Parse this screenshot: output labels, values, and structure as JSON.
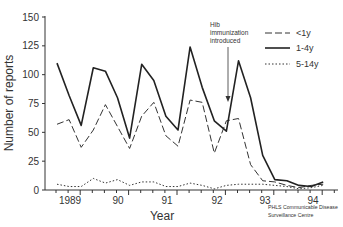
{
  "chart_data": {
    "type": "line",
    "title": "",
    "xlabel": "Year",
    "ylabel": "Number of reports",
    "ylim": [
      0,
      150
    ],
    "yticks": [
      0,
      25,
      50,
      75,
      100,
      125,
      150
    ],
    "xtick_labels": [
      "1989",
      "90",
      "91",
      "92",
      "93",
      "94"
    ],
    "x_quarters": [
      "1989Q1",
      "1989Q2",
      "1989Q3",
      "1989Q4",
      "1990Q1",
      "1990Q2",
      "1990Q3",
      "1990Q4",
      "1991Q1",
      "1991Q2",
      "1991Q3",
      "1991Q4",
      "1992Q1",
      "1992Q2",
      "1992Q3",
      "1992Q4",
      "1993Q1",
      "1993Q2",
      "1993Q3",
      "1993Q4",
      "1994Q1",
      "1994Q2",
      "1994Q3"
    ],
    "legend_position": "upper right",
    "grid": false,
    "series": [
      {
        "name": "<1y",
        "style": "dashed",
        "values": [
          57,
          61,
          37,
          52,
          74,
          55,
          36,
          64,
          76,
          47,
          38,
          78,
          76,
          32,
          60,
          62,
          22,
          8,
          7,
          4,
          2,
          4,
          5
        ]
      },
      {
        "name": "1-4y",
        "style": "solid",
        "values": [
          110,
          82,
          56,
          106,
          103,
          80,
          45,
          109,
          95,
          64,
          52,
          124,
          89,
          60,
          51,
          112,
          80,
          30,
          9,
          8,
          4,
          3,
          7
        ]
      },
      {
        "name": "5-14y",
        "style": "dotted",
        "values": [
          5,
          3,
          3,
          10,
          6,
          9,
          4,
          7,
          7,
          3,
          3,
          6,
          4,
          1,
          4,
          5,
          5,
          5,
          4,
          3,
          1,
          2,
          4
        ]
      }
    ],
    "annotations": [
      {
        "text": "Hib immunization introduced",
        "arrow_at": "1992Q4"
      },
      {
        "text": "PHLS Communicable Disease Surveillance Centre",
        "position": "bottom right"
      }
    ]
  },
  "axis": {
    "ylabel": "Number of reports",
    "xlabel": "Year",
    "yticks": [
      "0",
      "25",
      "50",
      "75",
      "100",
      "125",
      "150"
    ],
    "xticks": [
      "1989",
      "90",
      "91",
      "92",
      "93",
      "94"
    ]
  },
  "legend": {
    "items": [
      {
        "label": "<1y"
      },
      {
        "label": "1-4y"
      },
      {
        "label": "5-14y"
      }
    ]
  },
  "annotation": {
    "line1": "Hib",
    "line2": "immunization",
    "line3": "introduced"
  },
  "credit": {
    "line1": "PHLS Communicable Disease",
    "line2": "Surveillance Centre"
  }
}
